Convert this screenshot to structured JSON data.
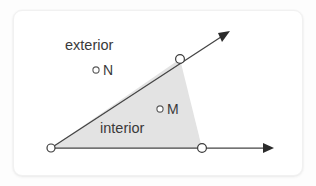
{
  "diagram": {
    "background_color": "#fdfdfd",
    "card_color": "#ffffff",
    "shaded_region_color": "#e3e3e3",
    "line_color": "#444444",
    "text_color": "#3a3a3a",
    "labels": {
      "exterior": "exterior",
      "interior": "interior",
      "point_n": "N",
      "point_m": "M"
    },
    "points": {
      "vertex": {
        "x": 51,
        "y": 148
      },
      "upper_ray_point": {
        "x": 180,
        "y": 59
      },
      "lower_ray_point": {
        "x": 202,
        "y": 148
      },
      "point_n_marker": {
        "x": 96,
        "y": 70
      },
      "point_m_marker": {
        "x": 160,
        "y": 109
      }
    },
    "rays": {
      "upper_arrow_tip": {
        "x": 230,
        "y": 31
      },
      "lower_arrow_tip": {
        "x": 274,
        "y": 148
      }
    }
  }
}
